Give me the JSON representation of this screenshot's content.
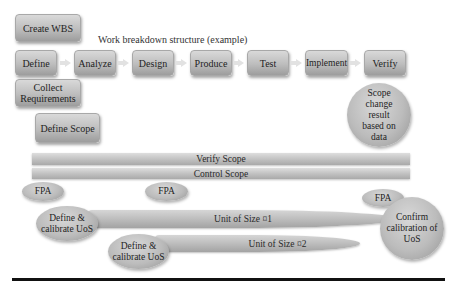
{
  "diagram": {
    "title": "Work breakdown structure (example)",
    "create_wbs": "Create WBS",
    "process_steps": [
      {
        "label": "Define"
      },
      {
        "label": "Analyze"
      },
      {
        "label": "Design"
      },
      {
        "label": "Produce"
      },
      {
        "label": "Test"
      },
      {
        "label": "Implement"
      },
      {
        "label": "Verify"
      }
    ],
    "collect_requirements": "Collect Requirements",
    "define_scope": "Define Scope",
    "scope_change": "Scope change result based on data",
    "verify_scope": "Verify Scope",
    "control_scope": "Control Scope",
    "fpa": [
      "FPA",
      "FPA",
      "FPA"
    ],
    "define_calibrate": [
      "Define & calibrate UoS",
      "Define & calibrate UoS"
    ],
    "unit_of_size": [
      "Unit of Size ¤1",
      "Unit of Size ¤2"
    ],
    "confirm_calibration": "Confirm calibration of UoS"
  },
  "colors": {
    "box_fill": "#bdbdbd",
    "arrow": "#e2e2e2",
    "rule": "#111111"
  }
}
